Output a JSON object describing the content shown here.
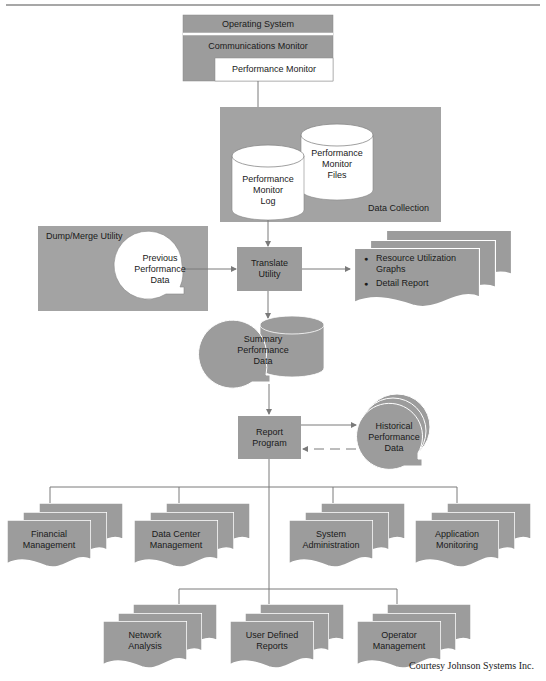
{
  "header_rule": true,
  "top_stack": {
    "operating_system": "Operating System",
    "communications_monitor": "Communications Monitor",
    "performance_monitor": "Performance Monitor"
  },
  "data_collection": {
    "label": "Data Collection",
    "log_db": [
      "Performance",
      "Monitor",
      "Log"
    ],
    "files_db": [
      "Performance",
      "Monitor",
      "Files"
    ]
  },
  "dump_merge": {
    "label": "Dump/Merge Utility",
    "previous_data": [
      "Previous",
      "Performance",
      "Data"
    ]
  },
  "translate_utility": [
    "Translate",
    "Utility"
  ],
  "outputs": {
    "items": [
      "Resource Utilization Graphs",
      "Detail Report"
    ]
  },
  "summary_data": [
    "Summary",
    "Performance",
    "Data"
  ],
  "report_program": [
    "Report",
    "Program"
  ],
  "historical_data": [
    "Historical",
    "Performance",
    "Data"
  ],
  "reports_row1": [
    {
      "line1": "Financial",
      "line2": "Management"
    },
    {
      "line1": "Data Center",
      "line2": "Management"
    },
    {
      "line1": "System",
      "line2": "Administration"
    },
    {
      "line1": "Application",
      "line2": "Monitoring"
    }
  ],
  "reports_row2": [
    {
      "line1": "Network",
      "line2": "Analysis"
    },
    {
      "line1": "User Defined",
      "line2": "Reports"
    },
    {
      "line1": "Operator",
      "line2": "Management"
    }
  ],
  "credit": "Courtesy Johnson Systems Inc.",
  "colors": {
    "box_fill": "#9c9c9c",
    "panel_fill": "#a3a3a3",
    "line": "#7a7a7a",
    "white": "#ffffff",
    "text": "#1a1a1a"
  }
}
